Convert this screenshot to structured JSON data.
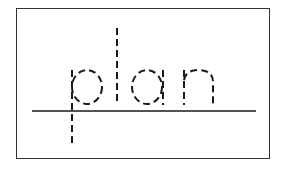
{
  "worksheet": {
    "word": "plan",
    "letters": [
      "p",
      "l",
      "a",
      "n"
    ],
    "style": "dashed tracing letters on a baseline",
    "colors": {
      "border": "#333333",
      "ink": "#1a1a1a",
      "background": "#ffffff"
    }
  }
}
